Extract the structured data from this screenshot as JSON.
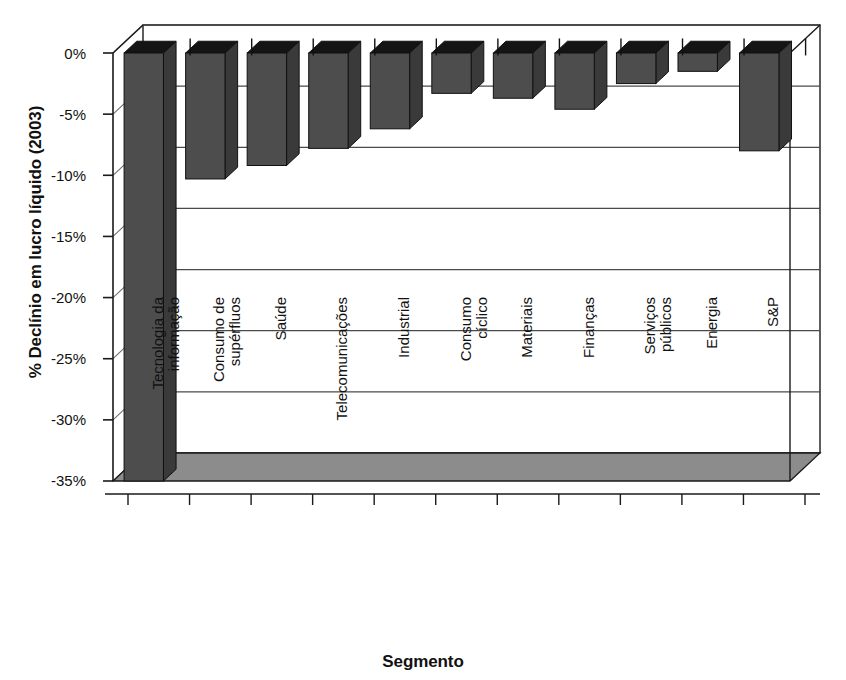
{
  "chart_data": {
    "type": "bar",
    "title": "",
    "xlabel": "Segmento",
    "ylabel": "% Declínio em lucro líquido (2003)",
    "ylim": [
      -35,
      0
    ],
    "ytick_labels": [
      "0%",
      "-5%",
      "-10%",
      "-15%",
      "-20%",
      "-25%",
      "-30%",
      "-35%"
    ],
    "ytick_values": [
      0,
      -5,
      -10,
      -15,
      -20,
      -25,
      -30,
      -35
    ],
    "grid": true,
    "legend": "none",
    "orientation": "vertical",
    "style": "3d-column",
    "categories": [
      "Tecnologia da informação",
      "Consumo de supérfluos",
      "Saúde",
      "Telecomunicações",
      "Industrial",
      "Consumo cíclico",
      "Materiais",
      "Finanças",
      "Serviços públicos",
      "Energia",
      "S&P"
    ],
    "category_lines": [
      [
        "Tecnologia da",
        "informação"
      ],
      [
        "Consumo de",
        "supérfluos"
      ],
      [
        "Saúde",
        ""
      ],
      [
        "Telecomunicações",
        ""
      ],
      [
        "Industrial",
        ""
      ],
      [
        "Consumo",
        "cíclico"
      ],
      [
        "Materiais",
        ""
      ],
      [
        "Finanças",
        ""
      ],
      [
        "Serviços",
        "públicos"
      ],
      [
        "Energia",
        ""
      ],
      [
        "S&P",
        ""
      ]
    ],
    "values": [
      -35.0,
      -10.3,
      -9.2,
      -7.8,
      -6.2,
      -3.3,
      -3.7,
      -4.6,
      -2.5,
      -1.5,
      -8.0
    ]
  },
  "colors": {
    "bar_front": "#4d4d4d",
    "bar_top": "#141414",
    "bar_side": "#3a3a3a",
    "floor": "#8c8c8c",
    "grid": "#4a4a4a",
    "axis": "#1a1a1a",
    "background": "#ffffff"
  }
}
